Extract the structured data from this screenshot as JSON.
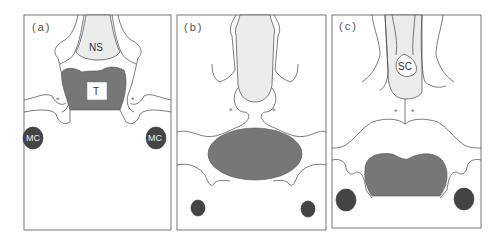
{
  "figure": {
    "panels": [
      {
        "label": "(a)",
        "structures": {
          "upper": "NS",
          "central": "T",
          "lateral_left": "MC",
          "lateral_right": "MC",
          "markers": [
            "*",
            "*"
          ]
        }
      },
      {
        "label": "(b)",
        "structures": {
          "markers": [
            "*",
            "*"
          ]
        }
      },
      {
        "label": "(c)",
        "structures": {
          "upper": "SC",
          "markers": [
            "*",
            "*"
          ]
        }
      }
    ],
    "colors": {
      "dark_fill": "#777777",
      "darker_fill": "#444444",
      "light_fill": "#ececec",
      "line": "#444444"
    }
  }
}
